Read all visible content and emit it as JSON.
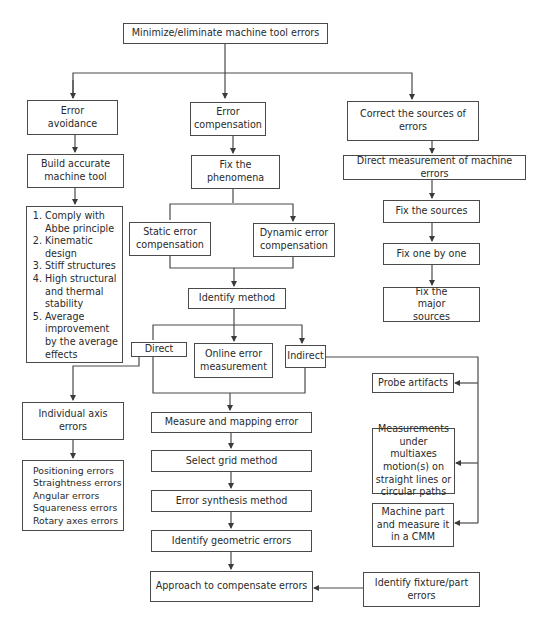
{
  "diagram": {
    "type": "flowchart",
    "nodes": {
      "root": "Minimize/eliminate machine tool errors",
      "error_avoidance": "Error avoidance",
      "error_compensation": "Error compensation",
      "correct_sources": "Correct the sources of errors",
      "build_accurate": "Build accurate machine tool",
      "avoidance_methods": [
        "Comply with Abbe principle",
        "Kinematic design",
        "Stiff structures",
        "High structural and thermal stability",
        "Average improvement by the average effects"
      ],
      "fix_phenomena": "Fix the phenomena",
      "static_comp": "Static error compensation",
      "dynamic_comp": "Dynamic error compensation",
      "identify_method": "Identify method",
      "direct": "Direct",
      "online_measurement": "Online error measurement",
      "indirect": "Indirect",
      "individual_axis": "Individual axis errors",
      "axis_error_types": [
        "Positioning errors",
        "Straightness errors",
        "Angular errors",
        "Squareness errors",
        "Rotary axes errors"
      ],
      "measure_mapping": "Measure and mapping error",
      "select_grid": "Select grid method",
      "error_synthesis": "Error synthesis method",
      "identify_geometric": "Identify geometric errors",
      "approach_compensate": "Approach to compensate errors",
      "direct_measurement": "Direct measurement of machine errors",
      "fix_sources": "Fix the sources",
      "fix_one_by_one": "Fix one by one",
      "fix_major": "Fix the major sources",
      "probe_artifacts": "Probe artifacts",
      "multiaxes_measurements": "Measurements under multiaxes motion(s) on straight lines or circular paths",
      "machine_part_cmm": "Machine part and measure it in a CMM",
      "identify_fixture": "Identify fixture/part errors"
    },
    "edges": [
      [
        "root",
        "error_avoidance"
      ],
      [
        "root",
        "error_compensation"
      ],
      [
        "root",
        "correct_sources"
      ],
      [
        "error_avoidance",
        "build_accurate"
      ],
      [
        "build_accurate",
        "avoidance_methods"
      ],
      [
        "error_compensation",
        "fix_phenomena"
      ],
      [
        "fix_phenomena",
        "static_comp"
      ],
      [
        "fix_phenomena",
        "dynamic_comp"
      ],
      [
        "static_comp",
        "identify_method"
      ],
      [
        "dynamic_comp",
        "identify_method"
      ],
      [
        "identify_method",
        "direct"
      ],
      [
        "identify_method",
        "online_measurement"
      ],
      [
        "identify_method",
        "indirect"
      ],
      [
        "direct",
        "individual_axis"
      ],
      [
        "individual_axis",
        "axis_error_types"
      ],
      [
        "direct",
        "measure_mapping"
      ],
      [
        "indirect",
        "measure_mapping"
      ],
      [
        "measure_mapping",
        "select_grid"
      ],
      [
        "select_grid",
        "error_synthesis"
      ],
      [
        "error_synthesis",
        "identify_geometric"
      ],
      [
        "identify_geometric",
        "approach_compensate"
      ],
      [
        "indirect",
        "probe_artifacts"
      ],
      [
        "indirect",
        "multiaxes_measurements"
      ],
      [
        "indirect",
        "machine_part_cmm"
      ],
      [
        "identify_fixture",
        "approach_compensate"
      ],
      [
        "correct_sources",
        "direct_measurement"
      ],
      [
        "direct_measurement",
        "fix_sources"
      ],
      [
        "fix_sources",
        "fix_one_by_one"
      ],
      [
        "fix_one_by_one",
        "fix_major"
      ]
    ],
    "colors": {
      "line": "#4a4a4a",
      "text": "#2a2a2a",
      "background": "#ffffff"
    }
  }
}
